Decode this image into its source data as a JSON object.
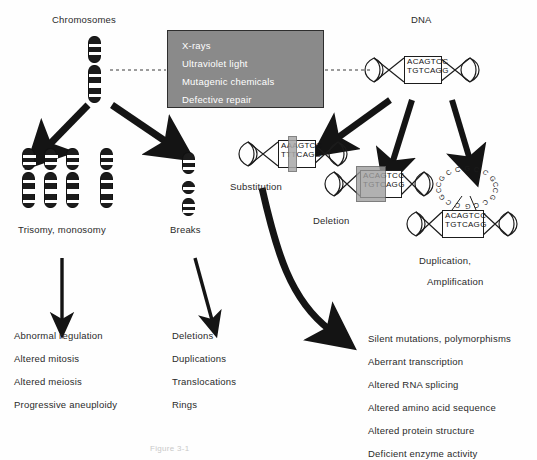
{
  "diagram": {
    "caption": "Figure 3-1"
  },
  "mutagens": {
    "items": [
      {
        "label": "X-rays"
      },
      {
        "label": "Ultraviolet light"
      },
      {
        "label": "Mutagenic chemicals"
      },
      {
        "label": "Defective repair"
      }
    ],
    "box_color": "#8a8a8a",
    "text_color": "#ffffff"
  },
  "branches": {
    "left_label": "Chromosomes",
    "right_label": "DNA"
  },
  "chromosome_path": {
    "aneuploidy_label": "Trisomy, monosomy",
    "breaks_label": "Breaks",
    "outcomes": [
      {
        "label": "Abnormal regulation"
      },
      {
        "label": "Altered mitosis"
      },
      {
        "label": "Altered meiosis"
      },
      {
        "label": "Progressive aneuploidy"
      }
    ],
    "break_outcomes": [
      {
        "label": "Deletions"
      },
      {
        "label": "Duplications"
      },
      {
        "label": "Translocations"
      },
      {
        "label": "Rings"
      }
    ]
  },
  "dna_path": {
    "wildtype": {
      "top": "ACAGTCC",
      "bottom": "TGTCAGG"
    },
    "mutations": [
      {
        "name": "substitution",
        "label": "Substitution",
        "top": "AAAGTCC",
        "bottom": "TTTCAGG"
      },
      {
        "name": "deletion",
        "label": "Deletion",
        "top": "ACAGTCC",
        "bottom": "TGTCAGG"
      },
      {
        "name": "duplication",
        "label_line1": "Duplication,",
        "label_line2": "Amplification",
        "top": "ACAGTCC",
        "bottom": "TGTCAGG",
        "repeat_unit": "GCCGCC"
      }
    ],
    "outcomes": [
      {
        "label": "Silent mutations, polymorphisms"
      },
      {
        "label": "Aberrant transcription"
      },
      {
        "label": "Altered RNA splicing"
      },
      {
        "label": "Altered amino acid sequence"
      },
      {
        "label": "Altered protein structure"
      },
      {
        "label": "Deficient enzyme activity"
      }
    ]
  }
}
